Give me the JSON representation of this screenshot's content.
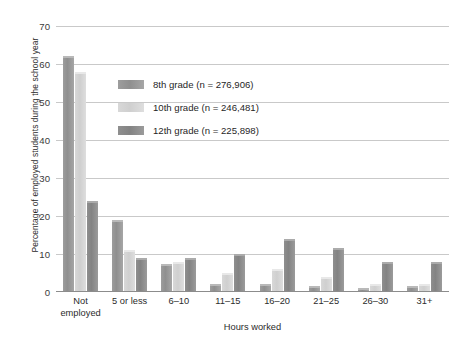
{
  "chart_data": {
    "type": "bar",
    "title": "",
    "xlabel": "Hours worked",
    "ylabel": "Percentage of employed students during the school year",
    "ylim": [
      0,
      70
    ],
    "yticks": [
      0,
      10,
      20,
      30,
      40,
      50,
      60,
      70
    ],
    "grid": true,
    "legend_position": "upper-center-left",
    "categories": [
      "Not employed",
      "5 or less",
      "6–10",
      "11–15",
      "16–20",
      "21–25",
      "26–30",
      "31+"
    ],
    "series": [
      {
        "name": "8th grade (n = 276,906)",
        "color": "#949494",
        "values": [
          62,
          19,
          7.5,
          2,
          2,
          1.5,
          1,
          1.5
        ]
      },
      {
        "name": "10th grade (n = 246,481)",
        "color": "#d4d4d4",
        "values": [
          58,
          11,
          8,
          5,
          6,
          4,
          2,
          2
        ]
      },
      {
        "name": "12th grade (n = 225,898)",
        "color": "#878787",
        "values": [
          24,
          9,
          9,
          10,
          14,
          11.5,
          8,
          8
        ]
      }
    ]
  },
  "legend": {
    "entries": [
      "8th grade (n = 276,906)",
      "10th grade (n = 246,481)",
      "12th grade (n = 225,898)"
    ]
  },
  "axis": {
    "y_title": "Percentage of employed students during the school year",
    "x_title": "Hours worked",
    "y_tick_labels": [
      "0",
      "10",
      "20",
      "30",
      "40",
      "50",
      "60",
      "70"
    ],
    "x_tick_labels": [
      "Not employed",
      "5 or less",
      "6–10",
      "11–15",
      "16–20",
      "21–25",
      "26–30",
      "31+"
    ]
  }
}
